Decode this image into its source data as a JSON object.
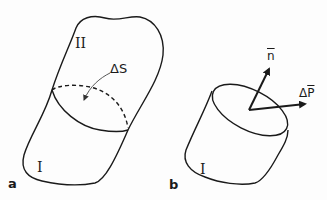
{
  "figure_a": {
    "label": "a",
    "region_upper": "II",
    "region_lower": "I",
    "surface_label": "ΔS"
  },
  "figure_b": {
    "label": "b",
    "region": "I",
    "normal_vector": "n",
    "force_prefix": "Δ",
    "force_vector": "P"
  },
  "colors": {
    "stroke": "#1a1a1a",
    "background": "#fdfdfd"
  }
}
